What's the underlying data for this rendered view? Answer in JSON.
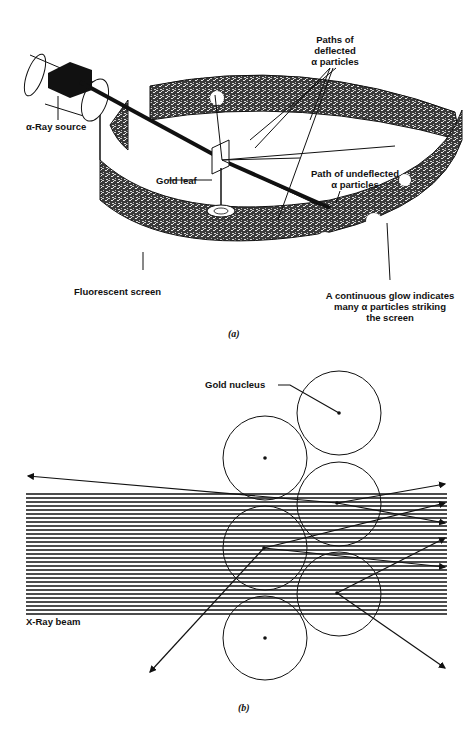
{
  "figure_a": {
    "caption": "(a)",
    "labels": {
      "alpha_source": "α-Ray source",
      "gold_leaf": "Gold leaf",
      "deflected_line1": "Paths of",
      "deflected_line2": "deflected",
      "deflected_line3": "α particles",
      "undeflected_line1": "Path of undeflected",
      "undeflected_line2": "α particles",
      "screen": "Fluorescent screen",
      "glow_line1": "A continuous glow indicates",
      "glow_line2": "many α particles striking",
      "glow_line3": "the screen"
    }
  },
  "figure_b": {
    "caption": "(b)",
    "labels": {
      "nucleus": "Gold nucleus",
      "beam": "X-Ray beam"
    }
  },
  "colors": {
    "ink": "#111111",
    "screen_fill": "#4a4a4a",
    "background": "#ffffff"
  }
}
